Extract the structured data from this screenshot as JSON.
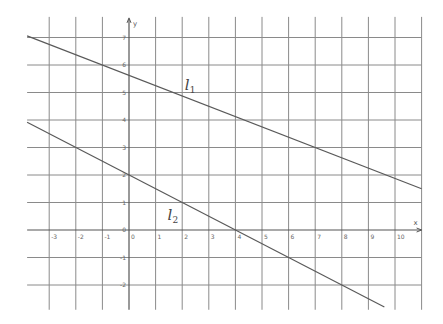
{
  "chart_data": {
    "type": "line",
    "title": "",
    "xlabel": "x",
    "ylabel": "y",
    "xlim": [
      -3.83,
      11.0
    ],
    "ylim": [
      -2.9,
      7.75
    ],
    "grid": true,
    "x_ticks": [
      -3,
      -2,
      -1,
      0,
      1,
      2,
      3,
      4,
      5,
      6,
      7,
      8,
      9,
      10
    ],
    "y_ticks": [
      -2,
      -1,
      0,
      1,
      2,
      3,
      4,
      5,
      6,
      7
    ],
    "x_origin_label": "0",
    "series": [
      {
        "name": "l1",
        "label_main": "l",
        "label_sub": "1",
        "equation": "y = -3/8 x + 45/8",
        "slope": -0.375,
        "intercept": 5.625,
        "x_range": [
          -3.83,
          11.0
        ],
        "points": [
          [
            -3.83,
            7.06
          ],
          [
            -1,
            6
          ],
          [
            2,
            4.875
          ],
          [
            7,
            3
          ],
          [
            11,
            1.5
          ]
        ],
        "label_pos": [
          2.1,
          5.1
        ]
      },
      {
        "name": "l2",
        "label_main": "l",
        "label_sub": "2",
        "equation": "y = -1/2 x + 2",
        "slope": -0.5,
        "intercept": 2,
        "x_range": [
          -3.83,
          9.6
        ],
        "points": [
          [
            -3.83,
            3.92
          ],
          [
            0,
            2
          ],
          [
            2,
            1
          ],
          [
            4,
            0
          ],
          [
            6,
            -1
          ],
          [
            8,
            -2
          ],
          [
            9.6,
            -2.8
          ]
        ],
        "label_pos": [
          1.45,
          0.35
        ]
      }
    ]
  }
}
